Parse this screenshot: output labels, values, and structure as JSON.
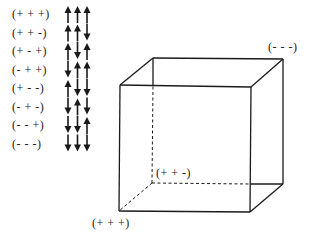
{
  "states": [
    {
      "label": "(+ + +)",
      "spins": [
        "up",
        "up",
        "up"
      ]
    },
    {
      "label": "(+ + -)",
      "spins": [
        "up",
        "up",
        "down"
      ]
    },
    {
      "label": "(+ - +)",
      "spins": [
        "up",
        "down",
        "up"
      ]
    },
    {
      "label": "(- + +)",
      "spins": [
        "down",
        "up",
        "up"
      ]
    },
    {
      "label": "(+ - -)",
      "spins": [
        "up",
        "down",
        "down"
      ]
    },
    {
      "label": "(- + -)",
      "spins": [
        "down",
        "up",
        "down"
      ]
    },
    {
      "label": "(- - +)",
      "spins": [
        "down",
        "down",
        "up"
      ]
    },
    {
      "label": "(- - -)",
      "spins": [
        "down",
        "down",
        "down"
      ]
    }
  ],
  "cube": {
    "labels": {
      "back_top_right": "(- - -)",
      "back_bottom_left": "(+ + -)",
      "front_bottom_left": "(+ + +)"
    },
    "front": {
      "tl": [
        120,
        85
      ],
      "tr": [
        251,
        87
      ],
      "bl": [
        119,
        211
      ],
      "br": [
        250,
        212
      ]
    },
    "back": {
      "tl": [
        153,
        58
      ],
      "tr": [
        283,
        59
      ],
      "bl": [
        152,
        183
      ],
      "br": [
        283,
        184
      ]
    },
    "hidden_edges": [
      "back_bl-back_tl",
      "back_bl-back_br",
      "back_bl-front_bl"
    ]
  },
  "colors": {
    "line": "#1a1a1a",
    "background": "#ffffff"
  }
}
